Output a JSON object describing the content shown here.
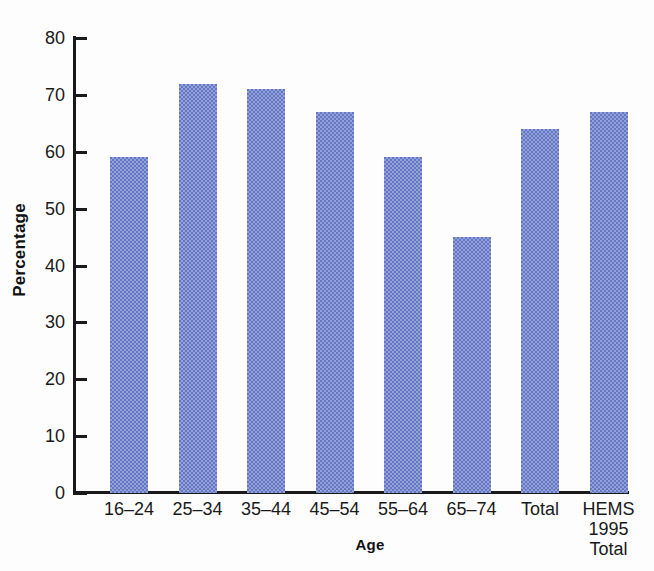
{
  "chart_data": {
    "type": "bar",
    "title": "",
    "subtitle": "",
    "xlabel": "Age",
    "ylabel": "Percentage",
    "categories": [
      "16–24",
      "25–34",
      "35–44",
      "45–54",
      "55–64",
      "65–74",
      "Total",
      "HEMS\n1995\nTotal"
    ],
    "category_lines": [
      [
        "16–24"
      ],
      [
        "25–34"
      ],
      [
        "35–44"
      ],
      [
        "45–54"
      ],
      [
        "55–64"
      ],
      [
        "65–74"
      ],
      [
        "Total"
      ],
      [
        "HEMS",
        "1995",
        "Total"
      ]
    ],
    "values": [
      59,
      72,
      71,
      67,
      59,
      45,
      64,
      67
    ],
    "ylim": [
      0,
      80
    ],
    "yticks": [
      0,
      10,
      20,
      30,
      40,
      50,
      60,
      70,
      80
    ],
    "ytick_labels": [
      "0",
      "10",
      "20",
      "30",
      "40",
      "50",
      "60",
      "70",
      "80"
    ],
    "grid": false,
    "legend": false,
    "bar_color": "#6478c6",
    "axis_color": "#1a1a1a",
    "background_color": "#fdfdfd"
  }
}
